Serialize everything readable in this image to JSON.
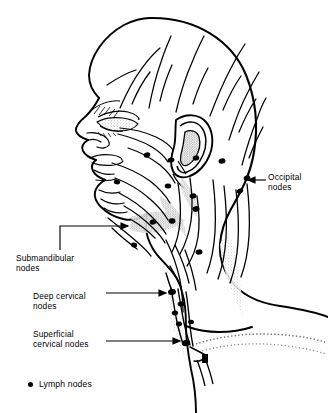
{
  "figure": {
    "style": "black and white anatomical line drawing",
    "background_color": "#ffffff",
    "ink_color": "#000000"
  },
  "labels": {
    "occipital": {
      "text": "Occipital\nnodes",
      "line1": "Occipital",
      "line2": "nodes",
      "leader": "arrow pointing left to back of neck"
    },
    "submandibular": {
      "text": "Submandibular\nnodes",
      "line1": "Submandibular",
      "line2": "nodes",
      "leader": "elbow line up then right, arrow at jawline"
    },
    "deep_cervical": {
      "text": "Deep cervical\nnodes",
      "line1": "Deep cervical",
      "line2": "nodes",
      "leader": "arrow pointing right to upper neck chain"
    },
    "superficial_cervical": {
      "text": "Superficial\ncervical nodes",
      "line1": "Superficial",
      "line2": "cervical nodes",
      "leader": "arrow pointing right to base of neck"
    }
  },
  "legend": {
    "marker": "filled-circle",
    "marker_color": "#000000",
    "text": "Lymph nodes"
  }
}
